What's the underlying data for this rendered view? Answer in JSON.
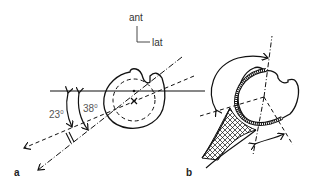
{
  "orientation": {
    "anterior_label": "ant",
    "lateral_label": "lat"
  },
  "panel_a": {
    "label": "a",
    "angle1": {
      "value": "23",
      "unit": "0"
    },
    "angle2": {
      "value": "38",
      "unit": "0"
    }
  },
  "panel_b": {
    "label": "b"
  },
  "colors": {
    "line": "#111111",
    "text": "#444444"
  }
}
